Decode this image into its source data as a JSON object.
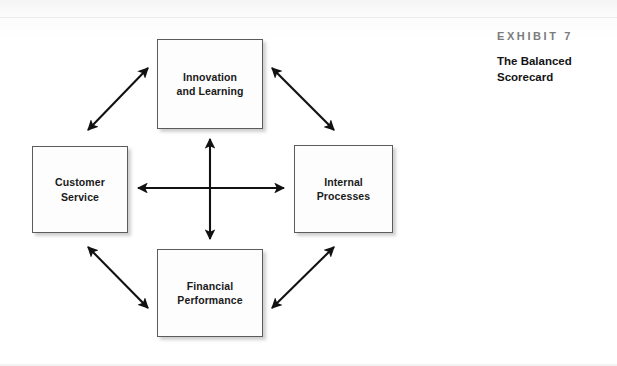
{
  "exhibit": {
    "number_label": "EXHIBIT 7",
    "title": "The Balanced\nScorecard"
  },
  "diagram": {
    "type": "cycle-diagram",
    "nodes": [
      {
        "id": "innovation",
        "label": "Innovation\nand Learning",
        "position": "top"
      },
      {
        "id": "customer",
        "label": "Customer\nService",
        "position": "left"
      },
      {
        "id": "internal",
        "label": "Internal\nProcesses",
        "position": "right"
      },
      {
        "id": "financial",
        "label": "Financial\nPerformance",
        "position": "bottom"
      }
    ],
    "connectors": [
      {
        "from": "innovation",
        "to": "customer",
        "style": "double-headed",
        "orientation": "diagonal"
      },
      {
        "from": "innovation",
        "to": "internal",
        "style": "double-headed",
        "orientation": "diagonal"
      },
      {
        "from": "customer",
        "to": "financial",
        "style": "double-headed",
        "orientation": "diagonal"
      },
      {
        "from": "internal",
        "to": "financial",
        "style": "double-headed",
        "orientation": "diagonal"
      },
      {
        "from": "customer",
        "to": "internal",
        "style": "double-headed",
        "orientation": "horizontal"
      },
      {
        "from": "innovation",
        "to": "financial",
        "style": "double-headed",
        "orientation": "vertical"
      }
    ],
    "colors": {
      "box_border": "#5b5b5b",
      "box_fill": "#fdfdfd",
      "arrow": "#111111",
      "label_text": "#1a1a1a",
      "exhibit_number_text": "#7b7b7b",
      "exhibit_title_text": "#141414",
      "background": "#ffffff"
    }
  }
}
